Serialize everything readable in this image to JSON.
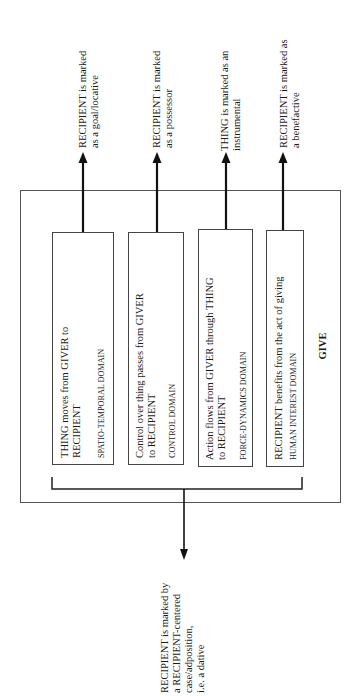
{
  "diagram": {
    "title": "GIVE",
    "domains": [
      {
        "description_lines": [
          "THING moves from GIVER to",
          "RECIPIENT"
        ],
        "domain_label": "SPATIO-TEMPORAL DOMAIN",
        "outcome_lines": [
          "RECIPIENT is marked",
          "as a goal/locative"
        ]
      },
      {
        "description_lines": [
          "Control over thing passes from GIVER",
          "to RECIPIENT"
        ],
        "domain_label": "CONTROL DOMAIN",
        "outcome_lines": [
          "RECIPIENT is marked",
          "as a possessor"
        ]
      },
      {
        "description_lines": [
          "Action flows from GIVER through THING",
          "to RECIPIENT"
        ],
        "domain_label": "FORCE-DYNAMICS DOMAIN",
        "outcome_lines": [
          "THING is marked as an",
          "instrumental"
        ]
      },
      {
        "description_lines": [
          "RECIPIENT benefits from the act of giving"
        ],
        "domain_label": "HUMAN INTEREST DOMAIN",
        "outcome_lines": [
          "RECIPIENT is marked as",
          "a benefactive"
        ]
      }
    ],
    "combined_outcome_lines": [
      "RECIPIENT is marked by",
      "a RECIPIENT-centered",
      "case/adposition,",
      "i.e. a dative"
    ]
  }
}
